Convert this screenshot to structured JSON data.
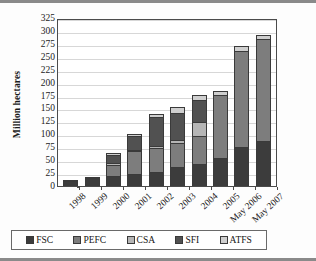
{
  "chart_data": {
    "type": "bar",
    "stacked": true,
    "title": "",
    "xlabel": "",
    "ylabel": "Million hectares",
    "ylim": [
      0,
      325
    ],
    "ytick_step": 25,
    "yticks": [
      0,
      25,
      50,
      75,
      100,
      125,
      150,
      175,
      200,
      225,
      250,
      275,
      300,
      325
    ],
    "grid": true,
    "grid_axis": "y",
    "legend_position": "bottom",
    "categories": [
      "1998",
      "1999",
      "2000",
      "2001",
      "2002",
      "2003",
      "2004",
      "2005",
      "May 2006",
      "May 2007"
    ],
    "series": [
      {
        "name": "FSC",
        "color": "#3c3c3c",
        "values": [
          9,
          16,
          19,
          24,
          28,
          36,
          43,
          54,
          75,
          88
        ]
      },
      {
        "name": "PEFC",
        "color": "#7d7d7d",
        "values": [
          0,
          0,
          22,
          43,
          45,
          48,
          53,
          123,
          186,
          196
        ]
      },
      {
        "name": "CSA",
        "color": "#b5b5b5",
        "values": [
          0,
          0,
          3,
          3,
          5,
          6,
          28,
          0,
          0,
          0
        ]
      },
      {
        "name": "SFI",
        "color": "#515151",
        "values": [
          2,
          1,
          17,
          26,
          55,
          51,
          42,
          0,
          0,
          0
        ]
      },
      {
        "name": "ATFS",
        "color": "#cfcfcf",
        "values": [
          0,
          0,
          2,
          4,
          7,
          11,
          11,
          6,
          10,
          9
        ]
      }
    ],
    "totals": [
      11,
      17,
      63,
      100,
      140,
      152,
      177,
      183,
      271,
      293
    ]
  },
  "legend": {
    "items": [
      {
        "label": "FSC",
        "color": "#3c3c3c"
      },
      {
        "label": "PEFC",
        "color": "#7d7d7d"
      },
      {
        "label": "CSA",
        "color": "#b5b5b5"
      },
      {
        "label": "SFI",
        "color": "#515151"
      },
      {
        "label": "ATFS",
        "color": "#cfcfcf"
      }
    ]
  },
  "axis": {
    "y_title": "Million hectares"
  }
}
